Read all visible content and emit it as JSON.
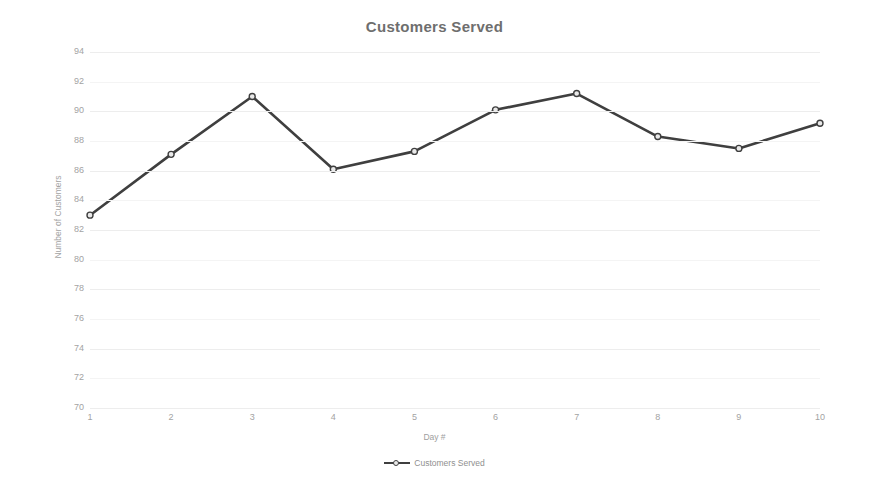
{
  "chart_data": {
    "type": "line",
    "title": "Customers Served",
    "xlabel": "Day #",
    "ylabel": "Number of Customers",
    "categories": [
      "1",
      "2",
      "3",
      "4",
      "5",
      "6",
      "7",
      "8",
      "9",
      "10"
    ],
    "series": [
      {
        "name": "Customers Served",
        "values": [
          83.0,
          87.1,
          91.0,
          86.1,
          87.3,
          90.1,
          91.2,
          88.3,
          87.5,
          89.2
        ]
      }
    ],
    "ylim": [
      70,
      94
    ],
    "yticks": [
      "70",
      "72",
      "74",
      "76",
      "78",
      "80",
      "82",
      "84",
      "86",
      "88",
      "90",
      "92",
      "94"
    ],
    "ytick_values": [
      70,
      72,
      74,
      76,
      78,
      80,
      82,
      84,
      86,
      88,
      90,
      92,
      94
    ],
    "xlim": [
      1,
      10
    ],
    "grid": true,
    "legend_position": "bottom",
    "marker": "circle-open",
    "line_color": "#3f3f3f",
    "marker_fill": "#e9e9e9",
    "grid_color": "#ededed",
    "title_color": "#6e6e6e",
    "tick_color": "#a3a3a3",
    "background": "#ffffff"
  },
  "legend": {
    "entries": [
      {
        "label": "Customers Served"
      }
    ]
  }
}
